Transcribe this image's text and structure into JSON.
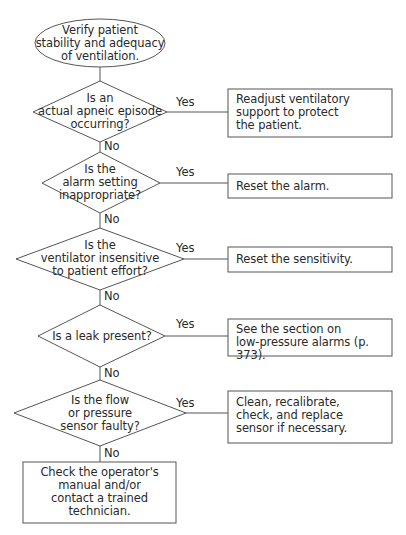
{
  "colors": {
    "stroke": "#555555",
    "text": "#2a2a2a",
    "background": "#ffffff"
  },
  "flowchart": {
    "start": {
      "text": "Verify patient\nstability and adequacy\nof ventilation."
    },
    "decisions": [
      {
        "text": "Is an\nactual apneic episode\noccurring?",
        "yes_label": "Yes",
        "no_label": "No",
        "action": "Readjust ventilatory\nsupport to protect\nthe patient."
      },
      {
        "text": "Is the\nalarm setting\ninappropriate?",
        "yes_label": "Yes",
        "no_label": "No",
        "action": "Reset the alarm."
      },
      {
        "text": "Is the\nventilator insensitive\nto patient effort?",
        "yes_label": "Yes",
        "no_label": "No",
        "action": "Reset the sensitivity."
      },
      {
        "text": "Is a leak present?",
        "yes_label": "Yes",
        "no_label": "No",
        "action": "See the section on\nlow-pressure alarms (p. 373)."
      },
      {
        "text": "Is the flow\nor pressure\nsensor faulty?",
        "yes_label": "Yes",
        "no_label": "No",
        "action": "Clean, recalibrate,\ncheck, and replace\nsensor if necessary."
      }
    ],
    "end": {
      "text": "Check the operator's\nmanual and/or\ncontact a trained\ntechnician."
    }
  }
}
